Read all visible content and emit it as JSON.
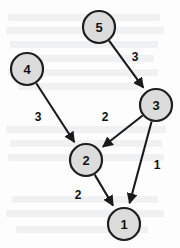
{
  "figure": {
    "width": 180,
    "height": 248,
    "background_color": "#fdfdfd"
  },
  "style": {
    "node_fill": "#dcdcdc",
    "node_stroke": "#1e1e1e",
    "edge_color": "#1a1a1a",
    "label_color": "#111111",
    "node_radius": 16
  },
  "chart_data": {
    "type": "diagram",
    "subtype": "weighted-directed-graph",
    "title": "",
    "directed": true,
    "nodes": [
      {
        "id": "5",
        "label": "5",
        "x": 99,
        "y": 27
      },
      {
        "id": "4",
        "label": "4",
        "x": 27,
        "y": 69
      },
      {
        "id": "3",
        "label": "3",
        "x": 156,
        "y": 105
      },
      {
        "id": "2",
        "label": "2",
        "x": 86,
        "y": 160
      },
      {
        "id": "1",
        "label": "1",
        "x": 124,
        "y": 224
      }
    ],
    "edges": [
      {
        "from": "5",
        "to": "3",
        "weight": "3",
        "label_x": 135,
        "label_y": 57
      },
      {
        "from": "4",
        "to": "2",
        "weight": "3",
        "label_x": 38,
        "label_y": 117
      },
      {
        "from": "3",
        "to": "2",
        "weight": "2",
        "label_x": 105,
        "label_y": 117
      },
      {
        "from": "3",
        "to": "1",
        "weight": "1",
        "label_x": 157,
        "label_y": 165
      },
      {
        "from": "2",
        "to": "1",
        "weight": "2",
        "label_x": 78,
        "label_y": 195
      }
    ],
    "legend": [],
    "annotations": []
  },
  "background_bleed": {
    "description": "faint show-through text from reverse of scanned page",
    "marks": [
      {
        "x": 8,
        "y": 14,
        "w": 152
      },
      {
        "x": 6,
        "y": 27,
        "w": 158
      },
      {
        "x": 10,
        "y": 41,
        "w": 148
      },
      {
        "x": 14,
        "y": 55,
        "w": 140
      },
      {
        "x": 8,
        "y": 69,
        "w": 150
      },
      {
        "x": 18,
        "y": 83,
        "w": 120
      },
      {
        "x": 6,
        "y": 126,
        "w": 160
      },
      {
        "x": 10,
        "y": 140,
        "w": 152
      },
      {
        "x": 8,
        "y": 154,
        "w": 156
      },
      {
        "x": 12,
        "y": 196,
        "w": 146
      },
      {
        "x": 6,
        "y": 210,
        "w": 158
      },
      {
        "x": 16,
        "y": 226,
        "w": 132
      }
    ]
  }
}
